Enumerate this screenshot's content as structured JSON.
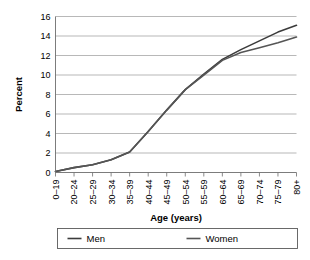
{
  "chart_data": {
    "type": "line",
    "title": "",
    "xlabel": "Age (years)",
    "ylabel": "Percent",
    "categories": [
      "0–19",
      "20–24",
      "25–29",
      "30–34",
      "35–39",
      "40–44",
      "45–49",
      "50–54",
      "55–59",
      "60–64",
      "65–69",
      "70–74",
      "75–79",
      "80+"
    ],
    "ylim": [
      0,
      16
    ],
    "yticks": [
      0,
      2,
      4,
      6,
      8,
      10,
      12,
      14,
      16
    ],
    "ytick_labels": [
      "0",
      "2",
      "4",
      "6",
      "8",
      "10",
      "12",
      "14",
      "16"
    ],
    "grid": "horizontal",
    "legend_position": "bottom",
    "series": [
      {
        "name": "Men",
        "color": "#3b3b3b",
        "values": [
          0.1,
          0.5,
          0.8,
          1.3,
          2.1,
          4.2,
          6.4,
          8.5,
          10.1,
          11.6,
          12.6,
          13.5,
          14.4,
          15.1
        ]
      },
      {
        "name": "Women",
        "color": "#555555",
        "values": [
          0.1,
          0.5,
          0.8,
          1.3,
          2.1,
          4.2,
          6.4,
          8.5,
          10.0,
          11.5,
          12.3,
          12.8,
          13.3,
          13.9
        ]
      }
    ]
  },
  "axes": {
    "y_axis_title": "Percent",
    "x_axis_title": "Age (years)"
  },
  "legend": {
    "entries": [
      {
        "label": "Men"
      },
      {
        "label": "Women"
      }
    ]
  }
}
